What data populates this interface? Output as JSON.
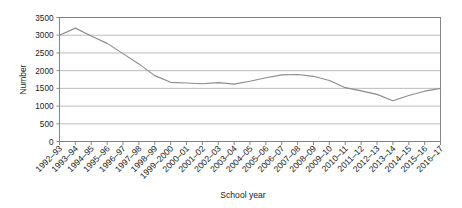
{
  "chart_data": {
    "type": "line",
    "title": "",
    "xlabel": "School year",
    "ylabel": "Number",
    "ylim": [
      0,
      3500
    ],
    "ytick_step": 500,
    "yticks": [
      0,
      500,
      1000,
      1500,
      2000,
      2500,
      3000,
      3500
    ],
    "ytick_labels": [
      "0",
      "500",
      "1000",
      "1500",
      "2000",
      "2500",
      "3000",
      "3500"
    ],
    "grid": true,
    "grid_axis": "y",
    "legend": false,
    "legend_position": "none",
    "line_color": "#8c8c8c",
    "grid_color": "#aaaaaa",
    "axis_color": "#7a7a7a",
    "categories": [
      "1992–93",
      "1993–94",
      "1994–95",
      "1995–96",
      "1996–97",
      "1997–98",
      "1998–99",
      "1999–2000",
      "2000–01",
      "2001–02",
      "2002–03",
      "2003–04",
      "2004–05",
      "2005–06",
      "2006–07",
      "2007–08",
      "2008–09",
      "2009–10",
      "2010–11",
      "2011–12",
      "2012–13",
      "2013–14",
      "2014–15",
      "2015–16",
      "2016–17"
    ],
    "values": [
      3000,
      3200,
      2980,
      2770,
      2480,
      2190,
      1860,
      1670,
      1650,
      1630,
      1660,
      1620,
      1700,
      1800,
      1880,
      1890,
      1840,
      1720,
      1520,
      1430,
      1330,
      1150,
      1300,
      1420,
      1500
    ]
  }
}
